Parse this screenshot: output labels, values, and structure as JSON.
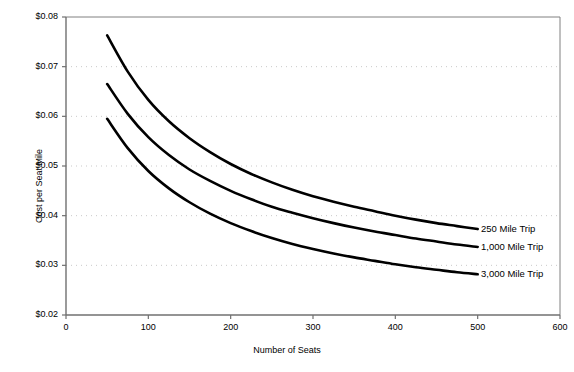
{
  "chart_data": {
    "type": "line",
    "title": "",
    "xlabel": "Number of Seats",
    "ylabel": "Cost per Seat Mile",
    "xlim": [
      0,
      600
    ],
    "ylim": [
      0.02,
      0.08
    ],
    "xticks": [
      0,
      100,
      200,
      300,
      400,
      500,
      600
    ],
    "xtick_labels": [
      "0",
      "100",
      "200",
      "300",
      "400",
      "500",
      "600"
    ],
    "yticks": [
      0.02,
      0.03,
      0.04,
      0.05,
      0.06,
      0.07,
      0.08
    ],
    "ytick_labels": [
      "$0.02",
      "$0.03",
      "$0.04",
      "$0.05",
      "$0.06",
      "$0.07",
      "$0.08"
    ],
    "grid": "horizontal-dotted",
    "grid_color": "#c9c9c9",
    "legend_position": "right-inline-at-line-ends",
    "line_color": "#000000",
    "x": [
      50,
      75,
      100,
      125,
      150,
      175,
      200,
      225,
      250,
      275,
      300,
      325,
      350,
      375,
      400,
      425,
      450,
      475,
      500
    ],
    "series": [
      {
        "name": "250 Mile Trip",
        "label": "250 Mile Trip",
        "values": [
          0.0763,
          0.069,
          0.0633,
          0.059,
          0.0556,
          0.0528,
          0.0504,
          0.0484,
          0.0467,
          0.0452,
          0.0439,
          0.0428,
          0.0418,
          0.0409,
          0.04,
          0.0392,
          0.0385,
          0.0379,
          0.0373
        ]
      },
      {
        "name": "1,000 Mile Trip",
        "label": "1,000 Mile Trip",
        "values": [
          0.0665,
          0.0605,
          0.0558,
          0.0522,
          0.0493,
          0.047,
          0.045,
          0.0433,
          0.0418,
          0.0406,
          0.0395,
          0.0385,
          0.0376,
          0.0368,
          0.0361,
          0.0354,
          0.0348,
          0.0342,
          0.0337
        ]
      },
      {
        "name": "3,000 Mile Trip",
        "label": "3,000 Mile Trip",
        "values": [
          0.0595,
          0.0536,
          0.049,
          0.0455,
          0.0427,
          0.0404,
          0.0385,
          0.0369,
          0.0355,
          0.0343,
          0.0333,
          0.0324,
          0.0316,
          0.0309,
          0.0302,
          0.0296,
          0.0291,
          0.0286,
          0.0282
        ]
      }
    ]
  }
}
